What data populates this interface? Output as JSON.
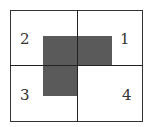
{
  "diagram": {
    "quadrants": [
      {
        "id": "q1",
        "label": "1"
      },
      {
        "id": "q2",
        "label": "2"
      },
      {
        "id": "q3",
        "label": "3"
      },
      {
        "id": "q4",
        "label": "4"
      }
    ],
    "shaded_color": "#5a5a5a",
    "line_color": "#333333"
  }
}
